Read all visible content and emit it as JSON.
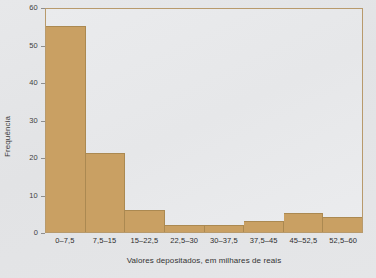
{
  "chart_data": {
    "type": "bar",
    "title": "",
    "subtitle": "",
    "xlabel": "Valores depositados, em milhares de reais",
    "ylabel": "Frequência",
    "categories": [
      "0–7,5",
      "7,5–15",
      "15–22,5",
      "22,5–30",
      "30–37,5",
      "37,5–45",
      "45–52,5",
      "52,5–60"
    ],
    "values": [
      55,
      21,
      6,
      2,
      2,
      3,
      5,
      4
    ],
    "ylim": [
      0,
      60
    ],
    "yticks": [
      0,
      10,
      20,
      30,
      40,
      50,
      60
    ],
    "ytick_labels": [
      "0",
      "10",
      "20",
      "30",
      "40",
      "50",
      "60"
    ],
    "grid": false,
    "legend": "none",
    "bar_gap": 0,
    "colors": {
      "bar_fill": "#c9a063",
      "bar_edge": "#ab8951",
      "plot_background": "#e8e9eb",
      "page_background": "#e4e5e7",
      "frame": "#b89a6c",
      "tick_label": "#3f3f3f",
      "axis_title": "#333333"
    }
  }
}
